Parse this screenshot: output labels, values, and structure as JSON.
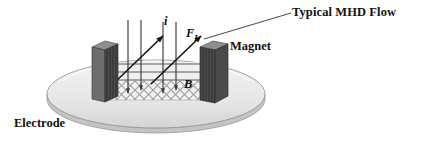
{
  "figure": {
    "title_label": "Typical MHD Flow",
    "background_color": "#ffffff",
    "width": 422,
    "height": 145
  },
  "labels": {
    "mhd_flow": "Typical MHD Flow",
    "magnet": "Magnet",
    "electrode": "Electrode",
    "current_symbol": "i",
    "force_symbol": "F",
    "force_subscript": "L",
    "magnetic_field_symbol": "B"
  },
  "colors": {
    "text": "#111111",
    "disk_face": "#e8e8e8",
    "disk_edge": "#9a9a9a",
    "disk_rim": "#c9c9c9",
    "magnet_front": "#3c3c3c",
    "magnet_top": "#8a8a8a",
    "magnet_side": "#6a6a6a",
    "b_field_arrow": "#8d8d8d",
    "current_arrow": "#3a3a3a",
    "force_arrow": "#1a1a1a",
    "channel_hatch": "#b5b5b5",
    "leader_line": "#555555"
  },
  "geometry": {
    "disk": {
      "cx": 156,
      "cy": 94,
      "rx": 109,
      "ry": 34
    },
    "magnet_left": {
      "x": 92,
      "y": 41,
      "w": 26,
      "h": 55
    },
    "magnet_right": {
      "x": 200,
      "y": 41,
      "w": 28,
      "h": 55
    },
    "channel": {
      "x1": 105,
      "x2": 215,
      "y_top": 62,
      "y_bottom": 100
    }
  },
  "elements": {
    "b_field_arrow_count": 3,
    "current_arrow_count": 4,
    "force_arrow_count": 2,
    "b_field_direction": "right",
    "current_direction": "down",
    "force_direction": "up-right"
  }
}
